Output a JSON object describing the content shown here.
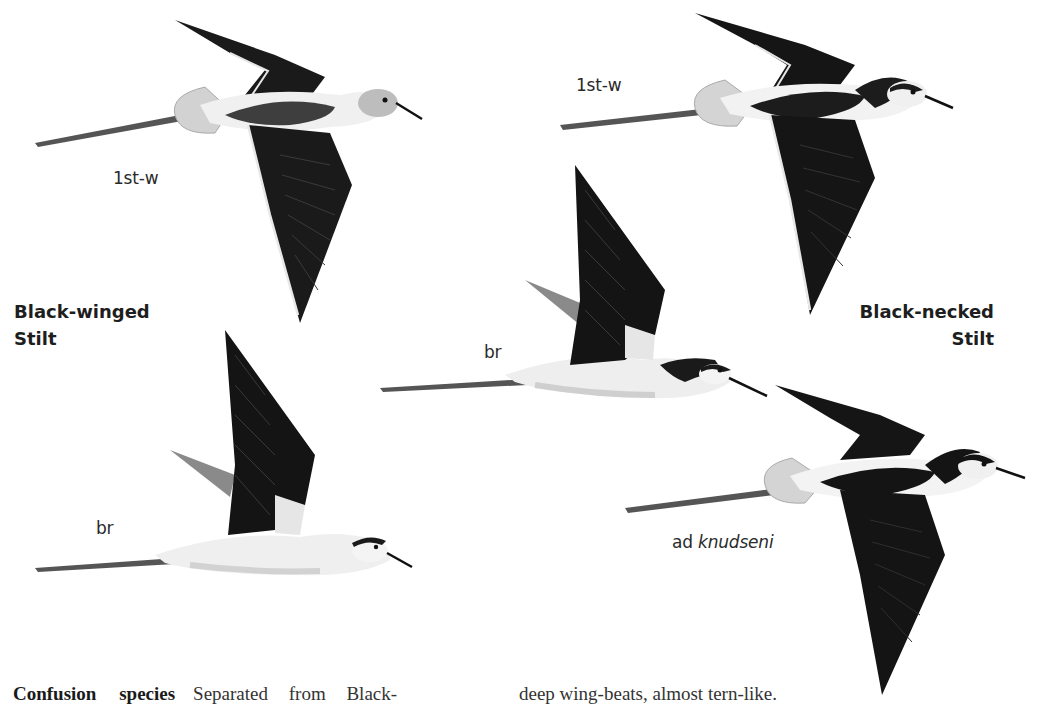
{
  "plate": {
    "species_left": {
      "line1": "Black-winged",
      "line2": "Stilt"
    },
    "species_right": {
      "line1": "Black-necked",
      "line2": "Stilt"
    },
    "figures": [
      {
        "id": "bw-1stw",
        "label": "1st-w",
        "species": "Black-winged Stilt",
        "pose": "wings down, dorsal view"
      },
      {
        "id": "bw-br",
        "label": "br",
        "species": "Black-winged Stilt",
        "pose": "wings up, side view"
      },
      {
        "id": "bn-1stw",
        "label": "1st-w",
        "species": "Black-necked Stilt",
        "pose": "wings down, dorsal view"
      },
      {
        "id": "bn-br",
        "label": "br",
        "species": "Black-necked Stilt",
        "pose": "wings up, side view"
      },
      {
        "id": "bn-knudseni",
        "label_prefix": "ad",
        "label_italic": "knudseni",
        "species": "Black-necked Stilt",
        "pose": "wings down, dorsal view"
      }
    ]
  },
  "text": {
    "heading": "Confusion species",
    "col1": "Separated from Black-",
    "col2": "deep wing-beats, almost tern-like."
  },
  "colors": {
    "wing_black": "#141414",
    "mantle_dark": "#2b2b2b",
    "juv_mantle": "#4a4a4a",
    "legs": "#555555",
    "tail_grey": "#cfcfcf",
    "belly_white": "#f2f2f2",
    "belly_shade": "#dcdcdc"
  }
}
